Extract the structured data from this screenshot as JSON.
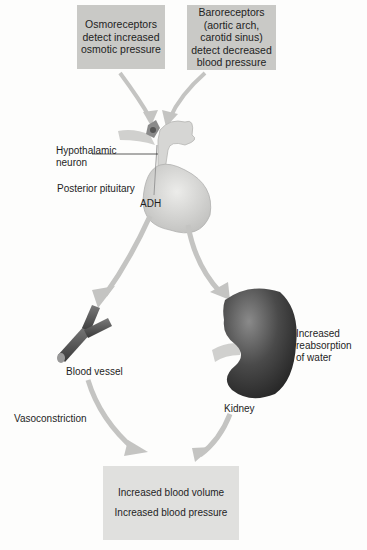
{
  "diagram": {
    "top_boxes": [
      {
        "lines": [
          "Osmoreceptors",
          "detect increased",
          "osmotic pressure"
        ]
      },
      {
        "lines": [
          "Baroreceptors",
          "(aortic arch,",
          "carotid sinus)",
          "detect decreased",
          "blood pressure"
        ]
      }
    ],
    "labels": {
      "hypothalamic_neuron": [
        "Hypothalamic",
        "neuron"
      ],
      "posterior_pituitary": "Posterior pituitary",
      "adh": "ADH",
      "blood_vessel": "Blood vessel",
      "kidney": "Kidney",
      "reabsorption": [
        "Increased",
        "reabsorption",
        "of water"
      ],
      "vasoconstriction": "Vasoconstriction"
    },
    "bottom_box": {
      "lines": [
        "Increased blood volume",
        "Increased blood pressure"
      ]
    },
    "colors": {
      "box_top": "#c9c9c6",
      "box_bottom": "#e0e0de",
      "arrow": "#c4c4c2",
      "kidney": "#4a4a4a",
      "vessel": "#5a5a5a",
      "pituitary": "#d6d6d4"
    }
  }
}
